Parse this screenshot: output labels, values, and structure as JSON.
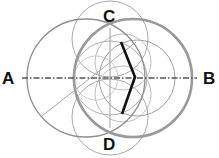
{
  "diagram": {
    "labels": {
      "a": "A",
      "b": "B",
      "c": "C",
      "d": "D"
    },
    "colors": {
      "background": "#ffffff",
      "thin_circle": "#a8a8a8",
      "medium_circle": "#8f8f8f",
      "bold_circle": "#9a9a9a",
      "axis": "#555555",
      "bold_line": "#111111",
      "label": "#111111"
    },
    "axis": {
      "style": "dash-dot",
      "from": [
        22,
        78
      ],
      "to": [
        197,
        78
      ]
    },
    "circles": [
      {
        "name": "left-large-circle",
        "cx": 86,
        "cy": 78,
        "r": 59
      },
      {
        "name": "right-large-bold-circle",
        "cx": 133,
        "cy": 78,
        "r": 59
      },
      {
        "name": "top-circle-c",
        "cx": 110,
        "cy": 39,
        "r": 38
      },
      {
        "name": "bottom-circle-d",
        "cx": 110,
        "cy": 117,
        "r": 38
      },
      {
        "name": "inner-left-circle",
        "cx": 110,
        "cy": 78,
        "r": 38
      },
      {
        "name": "inner-right-circle",
        "cx": 135,
        "cy": 78,
        "r": 38
      },
      {
        "name": "inner-upper-circle",
        "cx": 122,
        "cy": 60,
        "r": 30
      },
      {
        "name": "inner-lower-circle",
        "cx": 122,
        "cy": 96,
        "r": 30
      }
    ],
    "vertical_line": {
      "from": [
        110,
        28
      ],
      "to": [
        110,
        128
      ]
    },
    "diagonal_line": {
      "from": [
        42,
        116
      ],
      "to": [
        136,
        42
      ]
    },
    "bold_polyline": [
      [
        121,
        42
      ],
      [
        135,
        77
      ],
      [
        122,
        114
      ]
    ]
  }
}
